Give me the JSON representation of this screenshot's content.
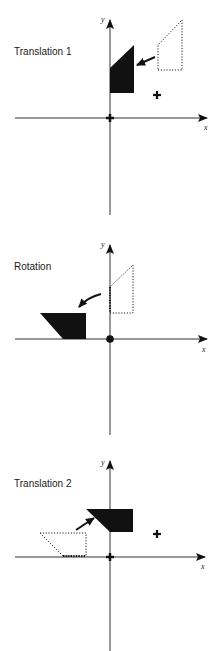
{
  "figure": {
    "colors": {
      "ink": "#111111",
      "axis": "#333333",
      "background": "#ffffff"
    }
  },
  "panels": [
    {
      "id": "translation-1",
      "title": "Translation 1",
      "x_axis_label": "x",
      "y_axis_label": "y",
      "origin_marker": "cross",
      "pivot_marker": "cross",
      "shapes": {
        "solid": "trapezoid moved so pivot is at origin",
        "dotted": "original trapezoid position"
      }
    },
    {
      "id": "rotation",
      "title": "Rotation",
      "x_axis_label": "x",
      "y_axis_label": "y",
      "origin_marker": "dot",
      "shapes": {
        "solid": "trapezoid rotated 90 degrees counter-clockwise about origin",
        "dotted": "trapezoid before rotation"
      }
    },
    {
      "id": "translation-2",
      "title": "Translation 2",
      "x_axis_label": "x",
      "y_axis_label": "y",
      "origin_marker": "cross",
      "pivot_marker": "cross",
      "shapes": {
        "solid": "rotated trapezoid translated back to pivot",
        "dotted": "rotated trapezoid at origin"
      }
    }
  ]
}
